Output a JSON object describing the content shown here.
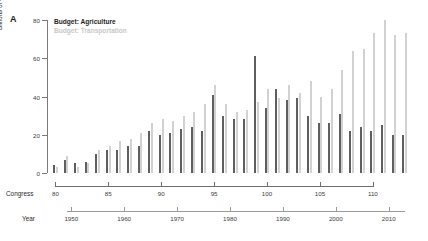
{
  "panel": {
    "label": "A"
  },
  "legend": {
    "series": [
      {
        "label": "Budget: Agriculture",
        "color": "#5f5f5f"
      },
      {
        "label": "Budget: Transportation",
        "color": "#d2d2d2"
      }
    ]
  },
  "axes": {
    "y": {
      "title": "Billions of Constant USD",
      "ticks": [
        "0",
        "20",
        "40",
        "60",
        "80"
      ],
      "tick_values": [
        0,
        20,
        40,
        60,
        80
      ],
      "limits": [
        0,
        80
      ]
    },
    "congress": {
      "title": "Congress",
      "ticks": [
        "80",
        "85",
        "90",
        "95",
        "100",
        "105",
        "110"
      ],
      "tick_values": [
        80,
        85,
        90,
        95,
        100,
        105,
        110
      ],
      "limits": [
        79.3,
        113.7
      ]
    },
    "year": {
      "title": "Year",
      "ticks": [
        "1950",
        "1960",
        "1970",
        "1980",
        "1990",
        "2000",
        "2010"
      ],
      "tick_values": [
        1950,
        1960,
        1970,
        1980,
        1990,
        2000,
        2010
      ],
      "limits": [
        1947,
        2014
      ]
    }
  },
  "chart_data": {
    "type": "bar",
    "title": "",
    "xlabel": "Congress",
    "ylabel": "Billions of Constant USD",
    "ylim": [
      0,
      80
    ],
    "grid": false,
    "legend_position": "top-left",
    "categories": [
      80,
      81,
      82,
      83,
      84,
      85,
      86,
      87,
      88,
      89,
      90,
      91,
      92,
      93,
      94,
      95,
      96,
      97,
      98,
      99,
      100,
      101,
      102,
      103,
      104,
      105,
      106,
      107,
      108,
      109,
      110,
      111,
      112,
      113
    ],
    "x_years": [
      1947,
      1949,
      1951,
      1953,
      1955,
      1957,
      1959,
      1961,
      1963,
      1965,
      1967,
      1969,
      1971,
      1973,
      1975,
      1977,
      1979,
      1981,
      1983,
      1985,
      1987,
      1989,
      1991,
      1993,
      1995,
      1997,
      1999,
      2001,
      2003,
      2005,
      2007,
      2009,
      2011,
      2013
    ],
    "series": [
      {
        "name": "Budget: Agriculture",
        "color": "#5f5f5f",
        "values": [
          4,
          7,
          5,
          6,
          10,
          12,
          12,
          14,
          14,
          22,
          20,
          21,
          23,
          24,
          22,
          41,
          30,
          28,
          28,
          61,
          34,
          44,
          38,
          39,
          30,
          26,
          26,
          31,
          22,
          24,
          22,
          25,
          20,
          20
        ]
      },
      {
        "name": "Budget: Transportation",
        "color": "#d2d2d2",
        "values": [
          3,
          9,
          3,
          5,
          12,
          14,
          17,
          18,
          21,
          26,
          28,
          27,
          30,
          32,
          36,
          46,
          36,
          32,
          33,
          37,
          44,
          39,
          46,
          42,
          48,
          40,
          44,
          54,
          64,
          65,
          73,
          80,
          72,
          73
        ]
      }
    ]
  }
}
